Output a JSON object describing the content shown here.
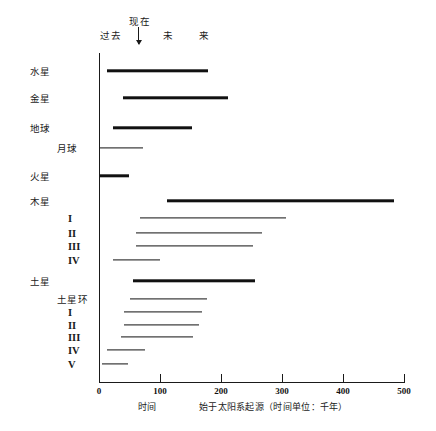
{
  "header": {
    "past": "过去",
    "present": "现在",
    "future_1": "未",
    "future_2": "来",
    "arrow_icon": "down-arrow-icon"
  },
  "axis": {
    "x_ticks": [
      0,
      100,
      200,
      300,
      400,
      500
    ],
    "x_tick_labels": [
      "0",
      "100",
      "200",
      "300",
      "400",
      "500"
    ],
    "x_min": 0,
    "x_max": 500,
    "caption_time": "时间",
    "caption_origin": "始于太阳系起源（时间单位：千年）"
  },
  "chart_data": {
    "type": "bar",
    "orientation": "horizontal-range",
    "title": "",
    "xlabel": "始于太阳系起源（时间单位：千年）",
    "ylabel": "",
    "xlim": [
      0,
      500
    ],
    "grid": false,
    "legend": null,
    "annotations": [
      "过去",
      "现在",
      "未",
      "来"
    ],
    "categories": [
      "水星",
      "金星",
      "地球",
      "月球",
      "火星",
      "木星",
      "I",
      "II",
      "III",
      "IV",
      "土星",
      "土星环",
      "I",
      "II",
      "III",
      "IV",
      "V"
    ],
    "rows": [
      {
        "label": "水星",
        "start": 13,
        "end": 179,
        "weight": "heavy",
        "indent": 0
      },
      {
        "label": "金星",
        "start": 39,
        "end": 212,
        "weight": "heavy",
        "indent": 0
      },
      {
        "label": "地球",
        "start": 23,
        "end": 152,
        "weight": "heavy",
        "indent": 0
      },
      {
        "label": "月球",
        "start": 2,
        "end": 72,
        "weight": "light",
        "indent": 1
      },
      {
        "label": "火星",
        "start": 2,
        "end": 49,
        "weight": "heavy",
        "indent": 0
      },
      {
        "label": "木星",
        "start": 112,
        "end": 484,
        "weight": "heavy",
        "indent": 0
      },
      {
        "label": "I",
        "start": 67,
        "end": 307,
        "weight": "light",
        "indent": 2
      },
      {
        "label": "II",
        "start": 61,
        "end": 267,
        "weight": "light",
        "indent": 2
      },
      {
        "label": "III",
        "start": 61,
        "end": 252,
        "weight": "light",
        "indent": 2
      },
      {
        "label": "IV",
        "start": 23,
        "end": 100,
        "weight": "light",
        "indent": 2
      },
      {
        "label": "土星",
        "start": 56,
        "end": 256,
        "weight": "heavy",
        "indent": 0
      },
      {
        "label": "土星环",
        "start": 51,
        "end": 177,
        "weight": "light",
        "indent": 1
      },
      {
        "label": "I",
        "start": 41,
        "end": 169,
        "weight": "light",
        "indent": 2
      },
      {
        "label": "II",
        "start": 41,
        "end": 164,
        "weight": "light",
        "indent": 2
      },
      {
        "label": "III",
        "start": 36,
        "end": 154,
        "weight": "light",
        "indent": 2
      },
      {
        "label": "IV",
        "start": 13,
        "end": 75,
        "weight": "light",
        "indent": 2
      },
      {
        "label": "V",
        "start": 5,
        "end": 48,
        "weight": "light",
        "indent": 2
      }
    ]
  }
}
